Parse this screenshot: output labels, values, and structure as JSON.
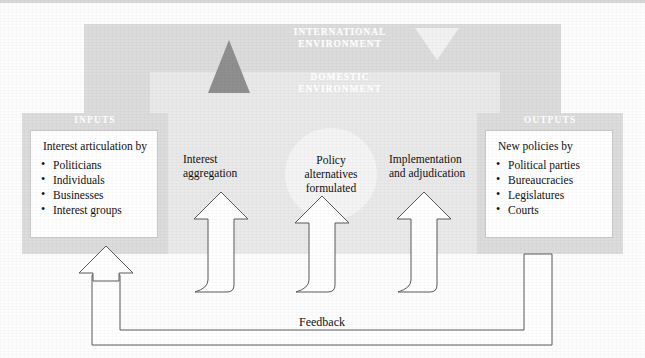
{
  "figure": {
    "environment": {
      "international_label_line1": "INTERNATIONAL",
      "international_label_line2": "ENVIRONMENT",
      "domestic_label_line1": "DOMESTIC",
      "domestic_label_line2": "ENVIRONMENT"
    },
    "inputs_panel": {
      "title": "INPUTS",
      "heading": "Interest articulation by",
      "items": [
        "Politicians",
        "Individuals",
        "Businesses",
        "Interest groups"
      ]
    },
    "outputs_panel": {
      "title": "OUTPUTS",
      "heading": "New policies by",
      "items": [
        "Political parties",
        "Bureaucracies",
        "Legislatures",
        "Courts"
      ]
    },
    "center_node": {
      "line1": "Policy",
      "line2": "alternatives",
      "line3": "formulated"
    },
    "process_left": {
      "line1": "Interest",
      "line2": "aggregation"
    },
    "process_right": {
      "line1": "Implementation",
      "line2": "and adjudication"
    },
    "feedback_label": "Feedback",
    "colors": {
      "environment_outer": "#dcdcdc",
      "environment_inner": "#e9e9e9",
      "panel_border_fill": "#dcdcdc",
      "panel_box_fill": "#ffffff",
      "circle_fill": "#f4f4f4",
      "triangle_dark": "#8f8f8f",
      "triangle_light": "#f2f2f2",
      "label_text": "#ffffff",
      "body_text": "#111111",
      "stroke": "#5a5a5a"
    }
  }
}
